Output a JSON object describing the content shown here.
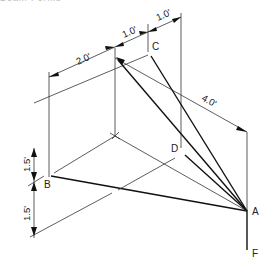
{
  "figure": {
    "caption_fragment": "Beam Forms",
    "points": {
      "A": "A",
      "B": "B",
      "C": "C",
      "D": "D",
      "F": "F"
    },
    "dimensions": {
      "top_right_1": "1.0'",
      "top_right_2": "1.0'",
      "top_left": "2.0'",
      "diagonal": "4.0'",
      "vertical_upper": "1.5'",
      "vertical_lower": "1.5'"
    }
  }
}
